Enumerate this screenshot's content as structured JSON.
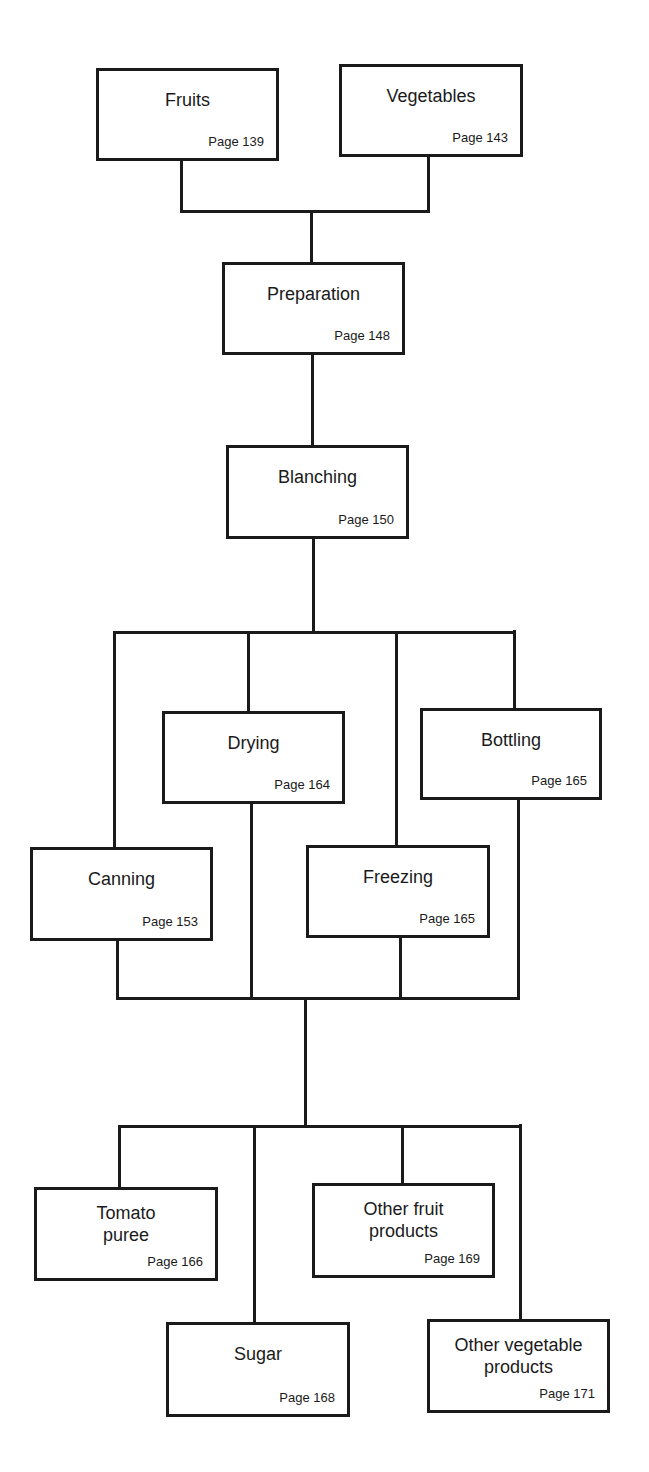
{
  "diagram": {
    "colors": {
      "line": "#1a1a1a",
      "background": "#ffffff"
    },
    "nodes": [
      {
        "id": "fruits",
        "label": "Fruits",
        "page": "Page 139",
        "x": 96,
        "y": 68,
        "w": 183,
        "h": 93,
        "lines": 1
      },
      {
        "id": "vegetables",
        "label": "Vegetables",
        "page": "Page 143",
        "x": 339,
        "y": 64,
        "w": 184,
        "h": 93,
        "lines": 1
      },
      {
        "id": "preparation",
        "label": "Preparation",
        "page": "Page 148",
        "x": 222,
        "y": 262,
        "w": 183,
        "h": 93,
        "lines": 1
      },
      {
        "id": "blanching",
        "label": "Blanching",
        "page": "Page 150",
        "x": 226,
        "y": 445,
        "w": 183,
        "h": 94,
        "lines": 1
      },
      {
        "id": "drying",
        "label": "Drying",
        "page": "Page 164",
        "x": 162,
        "y": 711,
        "w": 183,
        "h": 93,
        "lines": 1
      },
      {
        "id": "bottling",
        "label": "Bottling",
        "page": "Page 165",
        "x": 420,
        "y": 708,
        "w": 182,
        "h": 92,
        "lines": 1
      },
      {
        "id": "canning",
        "label": "Canning",
        "page": "Page 153",
        "x": 30,
        "y": 847,
        "w": 183,
        "h": 94,
        "lines": 1
      },
      {
        "id": "freezing",
        "label": "Freezing",
        "page": "Page 165",
        "x": 306,
        "y": 845,
        "w": 184,
        "h": 93,
        "lines": 1
      },
      {
        "id": "tomato-puree",
        "label": "Tomato\npuree",
        "label_lines": [
          "Tomato",
          "puree"
        ],
        "page": "Page 166",
        "x": 34,
        "y": 1187,
        "w": 184,
        "h": 94,
        "lines": 2
      },
      {
        "id": "other-fruit-products",
        "label": "Other fruit products",
        "label_lines": [
          "Other fruit",
          "products"
        ],
        "page": "Page 169",
        "x": 312,
        "y": 1183,
        "w": 183,
        "h": 95,
        "lines": 2
      },
      {
        "id": "sugar",
        "label": "Sugar",
        "page": "Page 168",
        "x": 166,
        "y": 1322,
        "w": 184,
        "h": 95,
        "lines": 1
      },
      {
        "id": "other-vegetable-products",
        "label": "Other vegetable products",
        "label_lines": [
          "Other vegetable",
          "products"
        ],
        "page": "Page 171",
        "x": 427,
        "y": 1319,
        "w": 183,
        "h": 94,
        "lines": 2
      }
    ],
    "connectors": [
      {
        "x": 180,
        "y": 160,
        "w": 3,
        "h": 53
      },
      {
        "x": 427,
        "y": 156,
        "w": 3,
        "h": 56
      },
      {
        "x": 180,
        "y": 210,
        "w": 250,
        "h": 3
      },
      {
        "x": 310,
        "y": 212,
        "w": 3,
        "h": 51
      },
      {
        "x": 311,
        "y": 354,
        "w": 3,
        "h": 92
      },
      {
        "x": 312,
        "y": 538,
        "w": 3,
        "h": 94
      },
      {
        "x": 113,
        "y": 631,
        "w": 403,
        "h": 3
      },
      {
        "x": 113,
        "y": 632,
        "w": 3,
        "h": 216
      },
      {
        "x": 247,
        "y": 632,
        "w": 3,
        "h": 80
      },
      {
        "x": 395,
        "y": 632,
        "w": 3,
        "h": 214
      },
      {
        "x": 513,
        "y": 630,
        "w": 3,
        "h": 79
      },
      {
        "x": 116,
        "y": 940,
        "w": 3,
        "h": 60
      },
      {
        "x": 250,
        "y": 803,
        "w": 3,
        "h": 197
      },
      {
        "x": 399,
        "y": 937,
        "w": 3,
        "h": 62
      },
      {
        "x": 517,
        "y": 799,
        "w": 3,
        "h": 199
      },
      {
        "x": 116,
        "y": 997,
        "w": 404,
        "h": 3
      },
      {
        "x": 304,
        "y": 998,
        "w": 3,
        "h": 128
      },
      {
        "x": 118,
        "y": 1125,
        "w": 403,
        "h": 3
      },
      {
        "x": 118,
        "y": 1126,
        "w": 3,
        "h": 62
      },
      {
        "x": 253,
        "y": 1126,
        "w": 3,
        "h": 197
      },
      {
        "x": 401,
        "y": 1125,
        "w": 3,
        "h": 59
      },
      {
        "x": 519,
        "y": 1124,
        "w": 3,
        "h": 196
      }
    ]
  }
}
